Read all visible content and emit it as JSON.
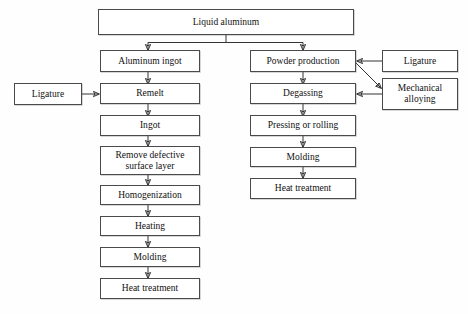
{
  "diagram": {
    "background_color": "#fffefe",
    "box_border_color": "#4a4a4a",
    "arrow_color": "#333333",
    "text_color": "#101010"
  },
  "nodes": {
    "liquid_aluminum": "Liquid aluminum",
    "aluminum_ingot": "Aluminum ingot",
    "ligature_left": "Ligature",
    "remelt": "Remelt",
    "ingot": "Ingot",
    "remove_defective_surface_layer": "Remove defective\nsurface layer",
    "homogenization": "Homogenization",
    "heating": "Heating",
    "molding_left": "Molding",
    "heat_treatment_left": "Heat treatment",
    "powder_production": "Powder production",
    "degassing": "Degassing",
    "pressing_or_rolling": "Pressing or rolling",
    "molding_right": "Molding",
    "heat_treatment_right": "Heat treatment",
    "ligature_right": "Ligature",
    "mechanical_alloying": "Mechanical\nalloying"
  },
  "flow": {
    "branch_left_label": "Ingot metallurgy route",
    "branch_right_label": "Powder metallurgy route",
    "steps_left": [
      "Liquid aluminum",
      "Aluminum ingot",
      "Remelt",
      "Ingot",
      "Remove defective surface layer",
      "Homogenization",
      "Heating",
      "Molding",
      "Heat treatment"
    ],
    "steps_right": [
      "Liquid aluminum",
      "Powder production",
      "Degassing",
      "Pressing or rolling",
      "Molding",
      "Heat treatment"
    ],
    "side_inputs": [
      "Ligature",
      "Ligature",
      "Mechanical alloying"
    ]
  }
}
